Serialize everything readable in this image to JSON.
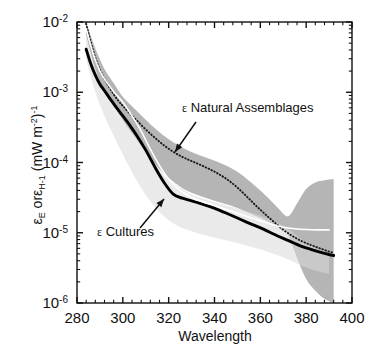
{
  "chart_data": {
    "type": "line",
    "title": "",
    "xlabel": "Wavelength",
    "ylabel": "εE orεH-1 (mW m-2)-1",
    "ylabel_parts": {
      "eps1": "ε",
      "sub1": "E",
      "mid": " or",
      "eps2": "ε",
      "sub2": "H-1",
      "units": " (mW m",
      "units_sup1": "-2",
      "units_close": ")",
      "units_sup2": "-1"
    },
    "xlim": [
      280,
      400
    ],
    "ylim": [
      1e-06,
      0.01
    ],
    "yscale": "log",
    "xticks": [
      280,
      300,
      320,
      340,
      360,
      380,
      400
    ],
    "xtick_labels": [
      "280",
      "300",
      "320",
      "340",
      "360",
      "380",
      "400"
    ],
    "xminor_count_per_interval": 4,
    "yticks": [
      1e-06,
      1e-05,
      0.0001,
      0.001,
      0.01
    ],
    "ytick_labels": [
      "10-6",
      "10-5",
      "10-4",
      "10-3",
      "10-2"
    ],
    "ytick_mantissa": "10",
    "ytick_exponents": [
      "-6",
      "-5",
      "-4",
      "-3",
      "-2"
    ],
    "grid": false,
    "legend_position": "inline-annotations",
    "series": [
      {
        "name": "ε Natural Assemblages",
        "style": "dotted",
        "color": "#1a1a1a",
        "x": [
          284,
          286,
          288,
          290,
          292,
          295,
          298,
          300,
          303,
          306,
          310,
          314,
          318,
          322,
          326,
          330,
          334,
          338,
          342,
          346,
          350,
          354,
          358,
          362,
          366,
          370,
          374,
          378,
          382,
          386,
          390,
          392
        ],
        "y": [
          0.0094,
          0.0052,
          0.0031,
          0.0021,
          0.00155,
          0.00105,
          0.00076,
          0.00064,
          0.0005,
          0.0004,
          0.000295,
          0.000225,
          0.000175,
          0.000142,
          0.00012,
          0.000105,
          9.2e-05,
          8e-05,
          6.8e-05,
          5.6e-05,
          4.4e-05,
          3.3e-05,
          2.45e-05,
          1.85e-05,
          1.42e-05,
          1.1e-05,
          9e-06,
          7.6e-06,
          6.7e-06,
          6e-06,
          5.4e-06,
          5.2e-06
        ]
      },
      {
        "name": "ε Cultures",
        "style": "solid",
        "color": "#000000",
        "x": [
          284,
          286,
          288,
          290,
          292,
          295,
          298,
          300,
          303,
          306,
          310,
          314,
          318,
          322,
          326,
          330,
          334,
          338,
          342,
          346,
          350,
          354,
          358,
          362,
          366,
          370,
          374,
          378,
          382,
          386,
          390,
          392
        ],
        "y": [
          0.0041,
          0.00255,
          0.00175,
          0.0013,
          0.00105,
          0.00076,
          0.00056,
          0.00046,
          0.00034,
          0.000245,
          0.00015,
          8.6e-05,
          5.2e-05,
          3.55e-05,
          3.1e-05,
          2.85e-05,
          2.6e-05,
          2.35e-05,
          2.1e-05,
          1.85e-05,
          1.62e-05,
          1.42e-05,
          1.25e-05,
          1.1e-05,
          9.5e-06,
          8.3e-06,
          7.3e-06,
          6.4e-06,
          5.8e-06,
          5.3e-06,
          4.9e-06,
          4.75e-06
        ]
      },
      {
        "name": "white-center-line",
        "style": "solid-white",
        "color": "#ffffff",
        "x": [
          284,
          287,
          290,
          293,
          296,
          300,
          304,
          308,
          312,
          316,
          320,
          325,
          330,
          335,
          340,
          345,
          350,
          355,
          360,
          365,
          370,
          375,
          380,
          385,
          390
        ],
        "y": [
          0.008,
          0.0036,
          0.002,
          0.00138,
          0.00102,
          0.00072,
          0.00046,
          0.00028,
          0.000155,
          9e-05,
          5.8e-05,
          4e-05,
          3.2e-05,
          2.75e-05,
          2.45e-05,
          2.15e-05,
          1.9e-05,
          1.68e-05,
          1.48e-05,
          1.32e-05,
          1.2e-05,
          1.14e-05,
          1.11e-05,
          1.1e-05,
          1.1e-05
        ]
      }
    ],
    "bands": [
      {
        "name": "natural-assemblages-range",
        "fill": "#a8a8a8",
        "opacity": 0.85,
        "x": [
          284,
          288,
          292,
          296,
          300,
          304,
          308,
          312,
          316,
          320,
          326,
          332,
          338,
          344,
          350,
          356,
          360,
          364,
          368,
          371,
          373,
          376,
          380,
          384,
          388,
          392
        ],
        "upper": [
          0.01,
          0.0042,
          0.00215,
          0.00135,
          0.00086,
          0.00063,
          0.00047,
          0.00035,
          0.00027,
          0.000215,
          0.000162,
          0.000132,
          0.000112,
          9.4e-05,
          7.4e-05,
          5.2e-05,
          4e-05,
          3e-05,
          2.2e-05,
          1.75e-05,
          1.8e-05,
          2.6e-05,
          4.2e-05,
          5.2e-05,
          5.6e-05,
          5.8e-05
        ],
        "lower": [
          0.0064,
          0.0021,
          0.00105,
          0.00063,
          0.0004,
          0.00026,
          0.000172,
          0.000115,
          8e-05,
          6e-05,
          4.3e-05,
          3.5e-05,
          3e-05,
          2.6e-05,
          2.25e-05,
          1.85e-05,
          1.62e-05,
          1.4e-05,
          1.2e-05,
          1.08e-05,
          8e-06,
          4.4e-06,
          2.2e-06,
          1.5e-06,
          1.15e-06,
          1e-06
        ]
      },
      {
        "name": "faint-lower-range",
        "fill": "#d8d8d8",
        "opacity": 0.55,
        "x": [
          284,
          288,
          292,
          296,
          300,
          306,
          312,
          318,
          324,
          330,
          336,
          342,
          348,
          354,
          360,
          366,
          372,
          378,
          384,
          390
        ],
        "upper": [
          0.0064,
          0.0021,
          0.00105,
          0.00063,
          0.0004,
          0.00022,
          0.000115,
          6.6e-05,
          4.6e-05,
          3.5e-05,
          3e-05,
          2.6e-05,
          2.3e-05,
          2e-05,
          1.75e-05,
          1.45e-05,
          1.15e-05,
          8e-06,
          6e-06,
          5e-06
        ],
        "lower": [
          0.0029,
          0.001,
          0.00046,
          0.00024,
          0.00013,
          5.6e-05,
          2.8e-05,
          1.7e-05,
          1.25e-05,
          1.05e-05,
          9.2e-06,
          8.2e-06,
          7.4e-06,
          6.6e-06,
          5.8e-06,
          5e-06,
          4.2e-06,
          3.4e-06,
          2.9e-06,
          2.6e-06
        ]
      }
    ],
    "annotations": [
      {
        "name": "natural-assemblages-label",
        "symbol": "ε",
        "text": " Natural Assemblages",
        "text_x": 182,
        "text_y": 112,
        "arrow_from": [
          196,
          122
        ],
        "arrow_to": [
          175,
          152
        ]
      },
      {
        "name": "cultures-label",
        "symbol": "ε",
        "text": " Cultures",
        "text_x": 97,
        "text_y": 236,
        "arrow_from": [
          140,
          228
        ],
        "arrow_to": [
          164,
          199
        ]
      }
    ]
  }
}
